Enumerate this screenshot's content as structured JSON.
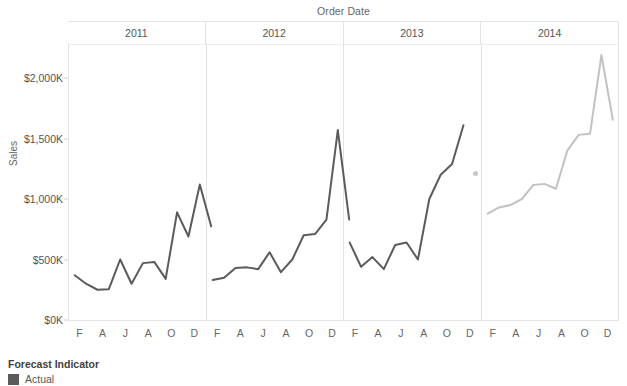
{
  "chart_data": {
    "type": "line",
    "title": "",
    "xlabel": "Order Date",
    "ylabel": "Sales",
    "ylim": [
      0,
      2200
    ],
    "ytick_values": [
      0,
      500,
      1000,
      1500,
      2000
    ],
    "ytick_labels": [
      "$0K",
      "$500K",
      "$1,000K",
      "$1,500K",
      "$2,000K"
    ],
    "grid": false,
    "legend": {
      "title": "Forecast Indicator",
      "position": "bottom-left",
      "entries": [
        {
          "label": "Actual",
          "color": "#5b5b5b"
        }
      ]
    },
    "panel_labels": [
      "2011",
      "2012",
      "2013",
      "2014"
    ],
    "xtick_labels": [
      "F",
      "A",
      "J",
      "A",
      "O",
      "D"
    ],
    "x_months": [
      "J",
      "F",
      "M",
      "A",
      "M",
      "J",
      "J",
      "A",
      "S",
      "O",
      "N",
      "D"
    ],
    "annotation_marker": {
      "label": "stray-point",
      "year": "2013",
      "month": "D",
      "value": 1210,
      "color": "#c7c7c7"
    },
    "series": [
      {
        "name": "2011",
        "forecast_indicator": "Actual",
        "color": "#5b5b5b",
        "categories": [
          "J",
          "F",
          "M",
          "A",
          "M",
          "J",
          "J",
          "A",
          "S",
          "O",
          "N",
          "D"
        ],
        "values": [
          370,
          300,
          250,
          255,
          500,
          300,
          470,
          480,
          340,
          890,
          690,
          1120,
          775
        ]
      },
      {
        "name": "2012",
        "forecast_indicator": "Actual",
        "color": "#5b5b5b",
        "categories": [
          "J",
          "F",
          "M",
          "A",
          "M",
          "J",
          "J",
          "A",
          "S",
          "O",
          "N",
          "D"
        ],
        "values": [
          330,
          350,
          430,
          435,
          420,
          560,
          395,
          500,
          700,
          710,
          830,
          1570,
          830
        ]
      },
      {
        "name": "2013",
        "forecast_indicator": "Actual",
        "color": "#5b5b5b",
        "categories": [
          "J",
          "F",
          "M",
          "A",
          "M",
          "J",
          "J",
          "A",
          "S",
          "O",
          "N",
          "D"
        ],
        "values": [
          640,
          440,
          520,
          420,
          620,
          640,
          500,
          1000,
          1200,
          1290,
          1610
        ]
      },
      {
        "name": "2014",
        "forecast_indicator": "Forecast",
        "color": "#c2c2c2",
        "categories": [
          "J",
          "F",
          "M",
          "A",
          "M",
          "J",
          "J",
          "A",
          "S",
          "O",
          "N",
          "D"
        ],
        "values": [
          880,
          930,
          950,
          1000,
          1115,
          1125,
          1085,
          1400,
          1530,
          1540,
          2190,
          1655
        ]
      }
    ]
  },
  "axis": {
    "x_title": "Order Date",
    "y_title": "Sales"
  }
}
